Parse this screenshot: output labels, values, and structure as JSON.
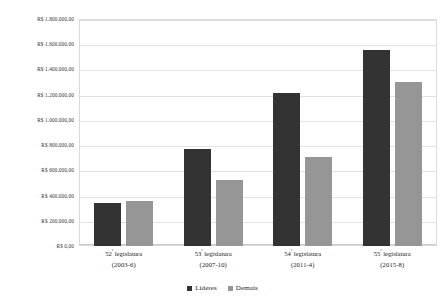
{
  "chart_data": {
    "type": "bar",
    "title": "",
    "subtitle": "",
    "xlabel": "",
    "ylabel": "",
    "ylim": [
      0,
      1800000
    ],
    "ytick_step": 200000,
    "grid": true,
    "legend_position": "bottom",
    "currency_prefix": "R$",
    "categories": [
      "52ª legislatura (2003-6)",
      "53ª legislatura (2007-10)",
      "54ª legislatura (2011-4)",
      "55ª legislatura (2015-8)"
    ],
    "category_parts": [
      {
        "ordinal": "52",
        "sup": "ª",
        "name": "legislatura",
        "years": "(2003-6)"
      },
      {
        "ordinal": "53",
        "sup": "ª",
        "name": "legislatura",
        "years": "(2007-10)"
      },
      {
        "ordinal": "54",
        "sup": "ª",
        "name": "legislatura",
        "years": "(2011-4)"
      },
      {
        "ordinal": "55",
        "sup": "ª",
        "name": "legislatura",
        "years": "(2015-8)"
      }
    ],
    "ytick_labels": [
      "R$ 0,00",
      "R$ 200.000,00",
      "R$ 400.000,00",
      "R$ 600.000,00",
      "R$ 800.000,00",
      "R$ 1.000.000,00",
      "R$ 1.200.000,00",
      "R$ 1.400.000,00",
      "R$ 1.600.000,00",
      "R$ 1.800.000,00"
    ],
    "ytick_values": [
      0,
      200000,
      400000,
      600000,
      800000,
      1000000,
      1200000,
      1400000,
      1600000,
      1800000
    ],
    "series": [
      {
        "name": "Líderes",
        "color": "#333333",
        "values": [
          340000,
          770000,
          1215000,
          1555000
        ]
      },
      {
        "name": "Demais",
        "color": "#969696",
        "values": [
          355000,
          525000,
          705000,
          1300000
        ]
      }
    ]
  },
  "legend": {
    "items": [
      {
        "label": "Líderes",
        "color": "#333333"
      },
      {
        "label": "Demais",
        "color": "#969696"
      }
    ]
  }
}
